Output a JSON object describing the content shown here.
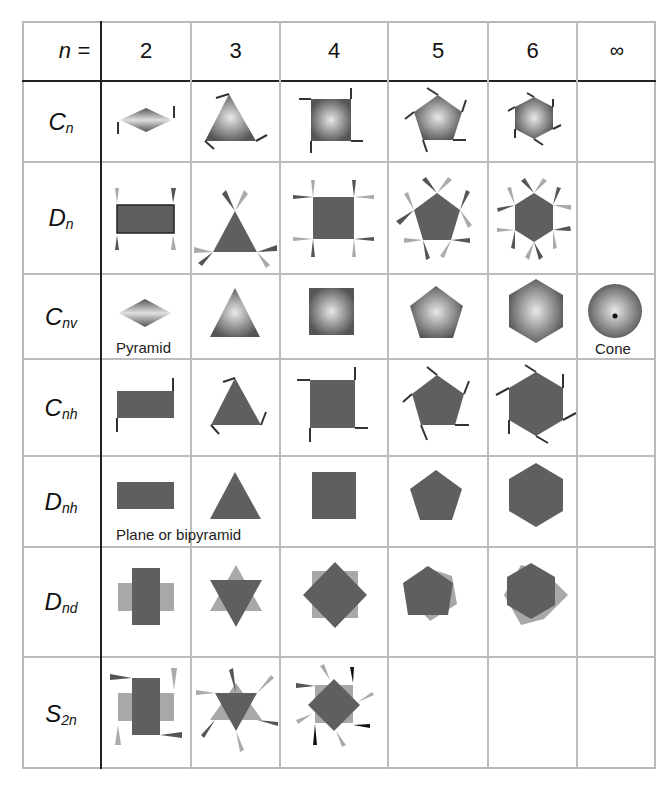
{
  "header": {
    "corner_label": "n =",
    "columns": [
      "2",
      "3",
      "4",
      "5",
      "6",
      "∞"
    ]
  },
  "rows": [
    {
      "symbol": "C",
      "sub": "n",
      "shapes": [
        "diamond-gradient-flags",
        "triangle-gradient-flags",
        "square-gradient-flags",
        "pentagon-gradient-flags",
        "hexagon-gradient-flags",
        ""
      ]
    },
    {
      "symbol": "D",
      "sub": "n",
      "shapes": [
        "rectangle-propellers",
        "triangle-propellers",
        "square-propellers",
        "pentagon-propellers",
        "hexagon-propellers",
        ""
      ]
    },
    {
      "symbol": "C",
      "sub": "nv",
      "shapes": [
        "diamond-gradient",
        "triangle-gradient",
        "square-gradient",
        "pentagon-gradient",
        "hexagon-gradient",
        "cone-circle"
      ]
    },
    {
      "symbol": "C",
      "sub": "nh",
      "shapes": [
        "rectangle-flags",
        "triangle-flags",
        "square-flags",
        "pentagon-flags",
        "hexagon-flags",
        ""
      ]
    },
    {
      "symbol": "D",
      "sub": "nh",
      "shapes": [
        "rectangle",
        "triangle",
        "square",
        "pentagon",
        "hexagon",
        ""
      ]
    },
    {
      "symbol": "D",
      "sub": "nd",
      "shapes": [
        "cross-rectangles",
        "star-of-david",
        "rotated-squares",
        "staggered-pentagons",
        "staggered-hexagons",
        ""
      ]
    },
    {
      "symbol": "S",
      "sub": "2n",
      "shapes": [
        "cross-rectangles-propellers",
        "star-propellers",
        "rotated-squares-propellers",
        "",
        "",
        ""
      ]
    }
  ],
  "captions": {
    "pyramid": "Pyramid",
    "cone": "Cone",
    "plane_or_bipyramid": "Plane or bipyramid"
  },
  "colors": {
    "shape_dark": "#5f5f5f",
    "shape_light": "#a8a8a8",
    "flag": "#3a3a3a",
    "grid": "#bdbdbd",
    "divider": "#222222"
  }
}
